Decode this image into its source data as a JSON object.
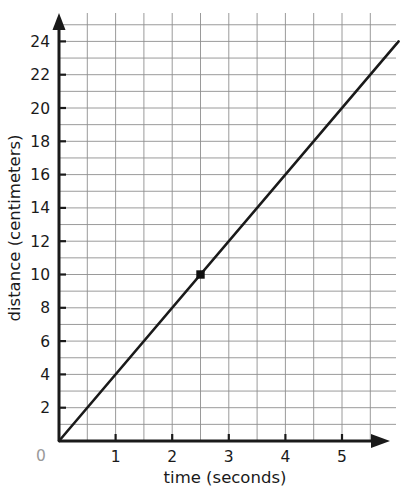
{
  "chart_data": {
    "type": "line",
    "title": "",
    "xlabel": "time (seconds)",
    "ylabel": "distance (centimeters)",
    "xlim": [
      0,
      6.4
    ],
    "ylim": [
      0,
      25.4
    ],
    "grid": true,
    "grid_major_x": 0.5,
    "grid_major_y": 1,
    "legend": "none",
    "x_tick_labels": [
      "1",
      "2",
      "3",
      "4",
      "5"
    ],
    "x_tick_values": [
      1,
      2,
      3,
      4,
      5
    ],
    "y_tick_labels": [
      "2",
      "4",
      "6",
      "8",
      "10",
      "12",
      "14",
      "16",
      "18",
      "20",
      "22",
      "24"
    ],
    "y_tick_values": [
      2,
      4,
      6,
      8,
      10,
      12,
      14,
      16,
      18,
      20,
      22,
      24
    ],
    "origin_label": "0",
    "series": [
      {
        "name": "distance vs time",
        "type": "line",
        "color": "#1a1a1a",
        "x": [
          0,
          6
        ],
        "y": [
          0,
          24
        ],
        "slope": 4,
        "intercept": 0
      }
    ],
    "points": [
      {
        "label": "",
        "x": 2.5,
        "y": 10,
        "marker": "square",
        "color": "#111111"
      }
    ]
  },
  "axes": {
    "x_axis_name": "x-axis",
    "y_axis_name": "y-axis",
    "x_arrow": "arrow-right",
    "y_arrow": "arrow-up"
  },
  "colors": {
    "line": "#1a1a1a",
    "axis": "#1a1a1a",
    "grid": "#8f8f8f",
    "origin_text": "#9a9a9a",
    "background": "#ffffff"
  }
}
